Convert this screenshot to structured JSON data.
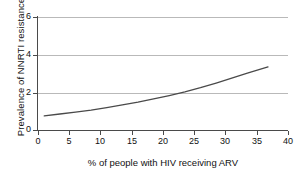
{
  "chart_data": {
    "type": "line",
    "title": "",
    "xlabel": "% of people with HIV receiving ARV",
    "ylabel": "Prevalence of NNRTI resistance",
    "xlim": [
      0,
      40
    ],
    "ylim": [
      0,
      6
    ],
    "xticks": [
      "0",
      "5",
      "10",
      "15",
      "20",
      "25",
      "30",
      "35",
      "40"
    ],
    "yticks": [
      "0",
      "2",
      "4",
      "6"
    ],
    "gridlines": {
      "horizontal": [
        2,
        4,
        6
      ],
      "vertical": []
    },
    "legend": {
      "visible": false,
      "position": "none",
      "entries": []
    },
    "series": [
      {
        "name": "NNRTI resistance",
        "color": "#4a4a4a",
        "x": [
          1.0,
          3.5,
          6.0,
          8.5,
          11.0,
          13.5,
          16.0,
          18.5,
          21.0,
          23.5,
          26.0,
          28.5,
          31.0,
          33.5,
          36.8
        ],
        "values": [
          0.75,
          0.85,
          0.95,
          1.06,
          1.19,
          1.33,
          1.48,
          1.65,
          1.83,
          2.03,
          2.25,
          2.49,
          2.75,
          3.02,
          3.35
        ]
      }
    ],
    "annotations": []
  },
  "axis": {
    "y_title": "Prevalence of NNRTI resistance",
    "x_title": "% of people with HIV receiving ARV",
    "y_tick_labels": [
      "6",
      "4",
      "2",
      "0"
    ],
    "x_tick_labels": [
      "0",
      "5",
      "10",
      "15",
      "20",
      "25",
      "30",
      "35",
      "40"
    ]
  },
  "colors": {
    "curve": "#4a4a4a",
    "axis": "#4a4a4a",
    "grid": "#b9b9b9",
    "background": "#ffffff",
    "text": "#111111"
  }
}
